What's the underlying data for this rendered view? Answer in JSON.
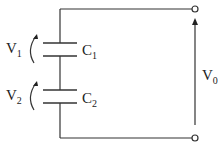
{
  "diagram": {
    "type": "capacitor-series-circuit",
    "components": [
      {
        "id": "C1",
        "label": "C",
        "subscript": "1",
        "voltage_label": "V",
        "voltage_subscript": "1"
      },
      {
        "id": "C2",
        "label": "C",
        "subscript": "2",
        "voltage_label": "V",
        "voltage_subscript": "2"
      }
    ],
    "output": {
      "label": "V",
      "subscript": "0"
    },
    "colors": {
      "wire": "#333333",
      "background": "#ffffff"
    }
  }
}
